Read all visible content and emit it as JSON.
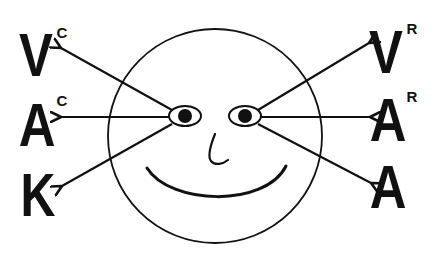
{
  "diagram": {
    "title": "",
    "face": {
      "description": "smiling face",
      "parts": [
        "head-circle",
        "left-eye",
        "right-eye",
        "nose",
        "smile"
      ]
    },
    "left_labels": [
      {
        "letter": "V",
        "superscript": "C"
      },
      {
        "letter": "A",
        "superscript": "C"
      },
      {
        "letter": "K",
        "superscript": ""
      }
    ],
    "right_labels": [
      {
        "letter": "V",
        "superscript": "R"
      },
      {
        "letter": "A",
        "superscript": "R"
      },
      {
        "letter": "A",
        "superscript": ""
      }
    ],
    "colors": {
      "ink": "#111111",
      "background": "#ffffff"
    }
  }
}
